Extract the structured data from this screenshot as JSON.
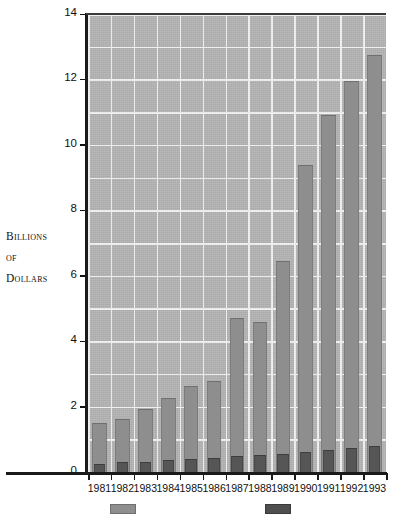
{
  "chart_data": {
    "type": "bar",
    "title": "",
    "subtitle": "",
    "xlabel": "",
    "ylabel": "Billions of Dollars",
    "ylabel_lines": [
      "Billions",
      "of",
      "Dollars"
    ],
    "categories": [
      "1981",
      "1982",
      "1983",
      "1984",
      "1985",
      "1986",
      "1987",
      "1988",
      "1989",
      "1990",
      "1991",
      "1992",
      "1993"
    ],
    "series": [
      {
        "name": "light-series",
        "color": "#8e8e8e",
        "values": [
          1.5,
          1.62,
          1.92,
          2.25,
          2.62,
          2.78,
          4.7,
          4.6,
          6.45,
          9.4,
          10.9,
          11.95,
          12.75
        ]
      },
      {
        "name": "dark-series",
        "color": "#565656",
        "values": [
          0.25,
          0.3,
          0.32,
          0.36,
          0.4,
          0.42,
          0.48,
          0.52,
          0.55,
          0.6,
          0.68,
          0.72,
          0.8
        ]
      }
    ],
    "ylim": [
      0,
      14
    ],
    "yticks": [
      0,
      2,
      4,
      6,
      8,
      10,
      12,
      14
    ],
    "ytick_labels": [
      "0",
      "2",
      "4",
      "6",
      "8",
      "10",
      "12",
      "14"
    ],
    "minor_gridlines": true,
    "minor_ystep": 1,
    "grid": true,
    "grid_color": "#f3f3f3",
    "plot_background": "#b4b4b4",
    "legend_position": "bottom"
  },
  "legend": {
    "entries": [
      {
        "label": "",
        "swatch_color": "#8e8e8e",
        "kind": "light"
      },
      {
        "label": "",
        "swatch_color": "#4f4f4f",
        "kind": "dark"
      }
    ]
  }
}
